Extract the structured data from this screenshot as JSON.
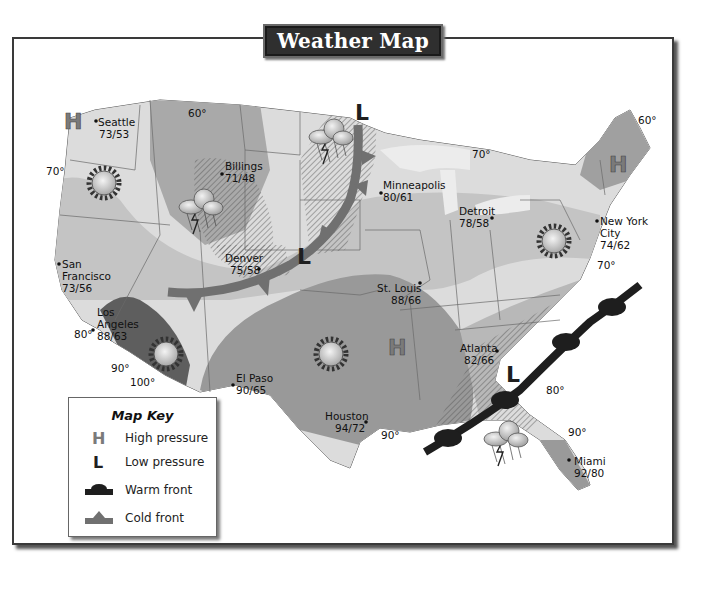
{
  "title": "Weather Map",
  "map_key": {
    "heading": "Map Key",
    "items": [
      {
        "symbol": "high-pressure-icon",
        "label": "High pressure"
      },
      {
        "symbol": "low-pressure-icon",
        "label": "Low pressure"
      },
      {
        "symbol": "warm-front-icon",
        "label": "Warm front"
      },
      {
        "symbol": "cold-front-icon",
        "label": "Cold front"
      }
    ]
  },
  "cities": [
    {
      "name": "Seattle",
      "temps": "73/53"
    },
    {
      "name": "Billings",
      "temps": "71/48"
    },
    {
      "name": "Minneapolis",
      "temps": "80/61"
    },
    {
      "name": "Detroit",
      "temps": "78/58"
    },
    {
      "name": "New York City",
      "line1": "New York",
      "line2": "City",
      "temps": "74/62"
    },
    {
      "name": "San Francisco",
      "line1": "San",
      "line2": "Francisco",
      "temps": "73/56"
    },
    {
      "name": "Denver",
      "temps": "75/58"
    },
    {
      "name": "Los Angeles",
      "line1": "Los",
      "line2": "Angeles",
      "temps": "88/63"
    },
    {
      "name": "St. Louis",
      "temps": "88/66"
    },
    {
      "name": "El Paso",
      "temps": "90/65"
    },
    {
      "name": "Atlanta",
      "temps": "82/66"
    },
    {
      "name": "Houston",
      "temps": "94/72"
    },
    {
      "name": "Miami",
      "temps": "92/80"
    }
  ],
  "isotherms": [
    {
      "id": "nw-60",
      "label": "60°"
    },
    {
      "id": "w-70",
      "label": "70°"
    },
    {
      "id": "lakes-70",
      "label": "70°"
    },
    {
      "id": "ne-60",
      "label": "60°"
    },
    {
      "id": "ec-70",
      "label": "70°"
    },
    {
      "id": "sw-80",
      "label": "80°"
    },
    {
      "id": "sw-90",
      "label": "90°"
    },
    {
      "id": "sw-100",
      "label": "100°"
    },
    {
      "id": "gulf-90",
      "label": "90°"
    },
    {
      "id": "se-80",
      "label": "80°"
    },
    {
      "id": "fl-90",
      "label": "90°"
    }
  ],
  "pressure_systems": [
    {
      "type": "high",
      "letter": "H",
      "location": "Pacific Northwest"
    },
    {
      "type": "high",
      "letter": "H",
      "location": "Arkansas"
    },
    {
      "type": "high",
      "letter": "H",
      "location": "New England"
    },
    {
      "type": "low",
      "letter": "L",
      "location": "Northern Minnesota"
    },
    {
      "type": "low",
      "letter": "L",
      "location": "Kansas/Nebraska"
    },
    {
      "type": "low",
      "letter": "L",
      "location": "Georgia"
    }
  ],
  "fronts": [
    {
      "type": "cold",
      "location": "Central Plains arc"
    },
    {
      "type": "warm",
      "location": "Southeast coast"
    }
  ],
  "weather_icons": [
    {
      "type": "sun",
      "location": "Oregon"
    },
    {
      "type": "sun",
      "location": "Arizona"
    },
    {
      "type": "sun",
      "location": "Oklahoma/Texas"
    },
    {
      "type": "sun",
      "location": "Pennsylvania"
    },
    {
      "type": "thunderstorm",
      "location": "Idaho/Montana"
    },
    {
      "type": "thunderstorm",
      "location": "North Dakota"
    },
    {
      "type": "thunderstorm",
      "location": "Gulf of Mexico"
    }
  ],
  "colors": {
    "zone_60": "#a9a9a9",
    "zone_70": "#cfcfcf",
    "zone_80": "#bdbdbd",
    "zone_90": "#979797",
    "zone_100": "#5e5e5e",
    "lakes": "#e6e6e6",
    "high_pressure": "#7a7a7a",
    "low_pressure": "#1f1f1f",
    "warm_front": "#1e1e1e",
    "cold_front": "#707070",
    "title_bg": "#2f2f2f"
  }
}
